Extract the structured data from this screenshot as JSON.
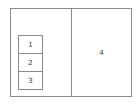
{
  "diagram": {
    "left_panel": {
      "cells": [
        {
          "label": "1"
        },
        {
          "label": "2"
        },
        {
          "label": "3"
        }
      ]
    },
    "right_panel": {
      "label": "4"
    },
    "colors": {
      "stroke": "#8a8a8a",
      "text": "#333333",
      "background": "#ffffff"
    }
  }
}
